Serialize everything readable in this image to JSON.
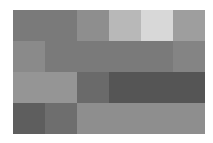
{
  "chart_data": {
    "type": "heatmap",
    "title": "",
    "xlabel": "",
    "ylabel": "",
    "rows": 4,
    "cols": 6,
    "colormap": "grayscale",
    "values": [
      [
        "#7a7a7a",
        "#7a7a7a",
        "#8e8e8e",
        "#b8b8b8",
        "#d8d8d8",
        "#9e9e9e"
      ],
      [
        "#8a8a8a",
        "#7a7a7a",
        "#7a7a7a",
        "#7a7a7a",
        "#7a7a7a",
        "#848484"
      ],
      [
        "#959595",
        "#959595",
        "#6a6a6a",
        "#555555",
        "#555555",
        "#555555"
      ],
      [
        "#5e5e5e",
        "#6e6e6e",
        "#8e8e8e",
        "#8e8e8e",
        "#8e8e8e",
        "#8e8e8e"
      ]
    ],
    "grid": false,
    "legend": null
  }
}
